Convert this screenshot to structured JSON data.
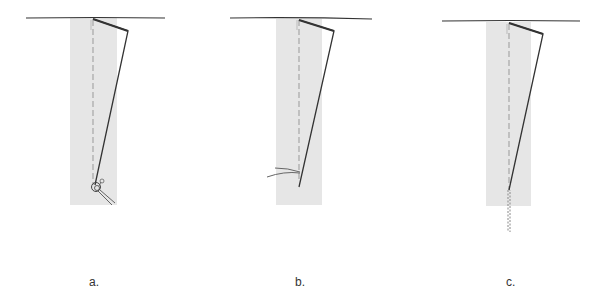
{
  "diagram": {
    "type": "sewing-dart-steps",
    "colors": {
      "fabric_strip": "#e6e6e6",
      "stitch_line": "#333333",
      "fold_line": "#999999",
      "thread": "#555555",
      "background": "#ffffff"
    },
    "panels": [
      {
        "id": "a",
        "label": "a.",
        "finish": "knot"
      },
      {
        "id": "b",
        "label": "b.",
        "finish": "thread-tails"
      },
      {
        "id": "c",
        "label": "c.",
        "finish": "chain-stitch"
      }
    ]
  }
}
